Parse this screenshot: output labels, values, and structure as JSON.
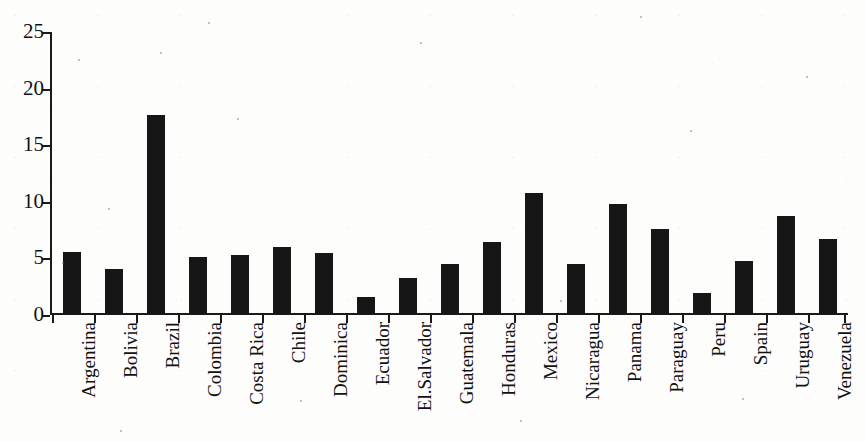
{
  "chart_data": {
    "type": "bar",
    "title": "",
    "subtitle": "",
    "xlabel": "",
    "ylabel": "",
    "ylim": [
      0,
      25
    ],
    "ytick_labels": [
      "25",
      "20",
      "15",
      "10",
      "5",
      "0"
    ],
    "ytick_values": [
      25,
      20,
      15,
      10,
      5,
      0
    ],
    "grid": false,
    "legend": null,
    "bar_color": "#161616",
    "axis_color": "#1a1a1a",
    "background_color": "#fdfdfb",
    "categories": [
      "Argentina",
      "Bolivia",
      "Brazil",
      "Colombia",
      "Costa Rica",
      "Chile",
      "Dominica",
      "Ecuador",
      "El.Salvador",
      "Guatemala",
      "Honduras",
      "Mexico",
      "Nicaragua",
      "Panama",
      "Paraguay",
      "Peru",
      "Spain",
      "Uruguay",
      "Venezuela"
    ],
    "values": [
      5.5,
      4.0,
      17.6,
      5.0,
      5.2,
      5.9,
      5.4,
      1.5,
      3.2,
      4.4,
      6.4,
      10.7,
      4.4,
      9.7,
      7.5,
      1.9,
      4.7,
      8.7,
      6.6
    ]
  }
}
